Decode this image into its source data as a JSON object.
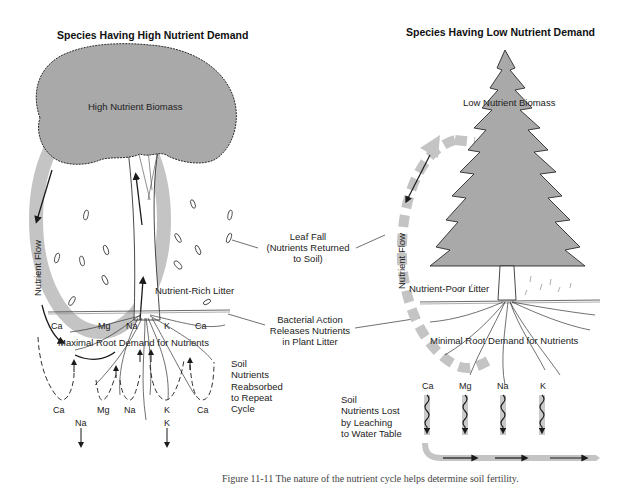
{
  "left_panel": {
    "title": "Species Having High Nutrient Demand",
    "canopy_label": "High Nutrient Biomass",
    "flow_label": "Nutrient Flow",
    "litter_label": "Nutrient-Rich Litter",
    "root_label": "Maximal Root Demand for Nutrients",
    "upper_ions": [
      "Ca",
      "Mg",
      "Na",
      "K",
      "Ca"
    ],
    "lower_ions": [
      "Ca",
      "Mg",
      "Na",
      "K",
      "Ca"
    ],
    "leached_ions": [
      "Na",
      "K"
    ],
    "soil_note": [
      "Soil",
      "Nutrients",
      "Reabsorbed",
      "to Repeat",
      "Cycle"
    ]
  },
  "center_callouts": {
    "leaf_fall": [
      "Leaf Fall",
      "(Nutrients Returned",
      "to Soil)"
    ],
    "bacterial": [
      "Bacterial Action",
      "Releases Nutrients",
      "in Plant Litter"
    ]
  },
  "right_panel": {
    "title": "Species Having Low Nutrient Demand",
    "canopy_label": "Low Nutrient Biomass",
    "flow_label": "Nutrient Flow",
    "litter_label": "Nutrient-Poor Litter",
    "root_label": "Minimal Root Demand for Nutrients",
    "ions": [
      "Ca",
      "Mg",
      "Na",
      "K"
    ],
    "soil_note": [
      "Soil",
      "Nutrients Lost",
      "by Leaching",
      "to Water Table"
    ]
  },
  "caption": "Figure 11-11  The nature of the nutrient cycle helps determine soil fertility.",
  "colors": {
    "canopy_fill": "#a9a9a9",
    "flow_band": "#c4c4c4",
    "line": "#1a1a1a",
    "background": "#ffffff"
  }
}
